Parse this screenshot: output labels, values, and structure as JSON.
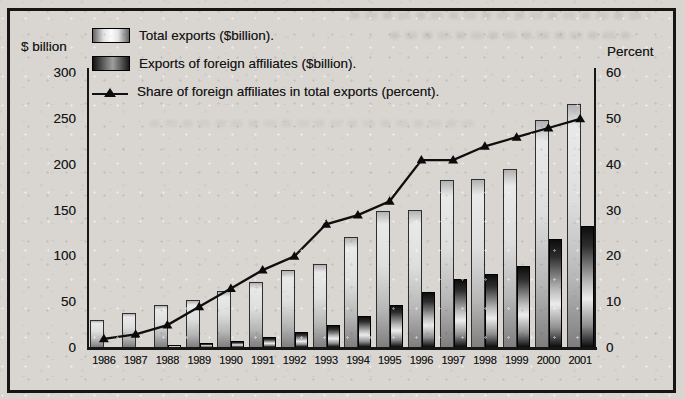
{
  "chart_data": {
    "type": "bar",
    "categories": [
      "1986",
      "1987",
      "1988",
      "1989",
      "1990",
      "1991",
      "1992",
      "1993",
      "1994",
      "1995",
      "1996",
      "1997",
      "1998",
      "1999",
      "2000",
      "2001"
    ],
    "series": [
      {
        "name": "Total exports ($billion).",
        "type": "bar",
        "axis": "left",
        "values": [
          31,
          38,
          47,
          52,
          62,
          72,
          85,
          92,
          121,
          149,
          151,
          183,
          184,
          195,
          249,
          266
        ]
      },
      {
        "name": "Exports of foreign affiliates ($billion).",
        "type": "bar",
        "axis": "left",
        "values": [
          1,
          1,
          3,
          5,
          8,
          12,
          17,
          25,
          35,
          47,
          61,
          75,
          81,
          89,
          119,
          133
        ]
      },
      {
        "name": "Share of foreign affiliates in total exports (percent).",
        "type": "line",
        "axis": "right",
        "values": [
          2,
          3,
          5,
          9,
          13,
          17,
          20,
          27,
          29,
          32,
          41,
          41,
          44,
          46,
          48,
          50
        ]
      }
    ],
    "left_axis": {
      "title": "$ billion",
      "min": 0,
      "max": 300,
      "ticks": [
        0,
        50,
        100,
        150,
        200,
        250,
        300
      ]
    },
    "right_axis": {
      "title": "Percent",
      "min": 0,
      "max": 60,
      "ticks": [
        0,
        10,
        20,
        30,
        40,
        50,
        60
      ]
    },
    "grid": false,
    "legend_position": "top-left",
    "colors": {
      "line": "#0e0e0e",
      "bar_outline": "#1a1a1a",
      "paper": "#d9d6d1",
      "frame": "#151515"
    }
  }
}
